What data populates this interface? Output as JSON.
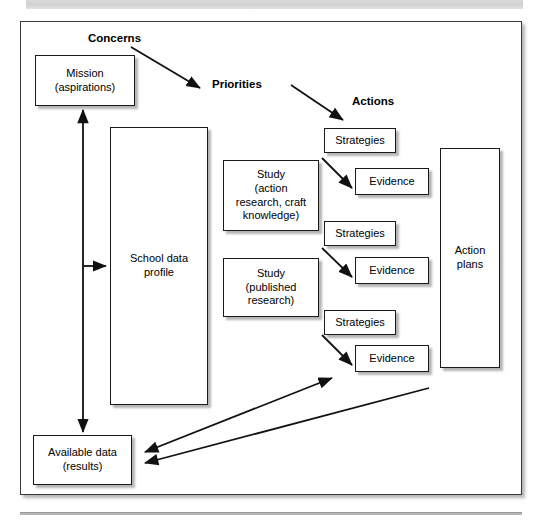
{
  "figure": {
    "type": "process-flow-diagram",
    "headings": [
      {
        "id": "concerns",
        "label": "Concerns",
        "x": 88,
        "y": 32
      },
      {
        "id": "priorities",
        "label": "Priorities",
        "x": 212,
        "y": 78
      },
      {
        "id": "actions",
        "label": "Actions",
        "x": 352,
        "y": 95
      }
    ],
    "nodes": [
      {
        "id": "mission",
        "label": "Mission\n(aspirations)",
        "x": 35,
        "y": 55,
        "w": 100,
        "h": 51
      },
      {
        "id": "school-data",
        "label": "School data\nprofile",
        "x": 110,
        "y": 127,
        "w": 98,
        "h": 278
      },
      {
        "id": "study-action",
        "label": "Study\n(action\nresearch, craft\nknowledge)",
        "x": 223,
        "y": 160,
        "w": 96,
        "h": 71
      },
      {
        "id": "study-published",
        "label": "Study\n(published\nresearch)",
        "x": 223,
        "y": 258,
        "w": 96,
        "h": 59
      },
      {
        "id": "strategies-1",
        "label": "Strategies",
        "x": 324,
        "y": 128,
        "w": 72,
        "h": 25
      },
      {
        "id": "evidence-1",
        "label": "Evidence",
        "x": 355,
        "y": 168,
        "w": 74,
        "h": 27
      },
      {
        "id": "strategies-2",
        "label": "Strategies",
        "x": 324,
        "y": 221,
        "w": 72,
        "h": 25
      },
      {
        "id": "evidence-2",
        "label": "Evidence",
        "x": 355,
        "y": 257,
        "w": 74,
        "h": 27
      },
      {
        "id": "strategies-3",
        "label": "Strategies",
        "x": 324,
        "y": 310,
        "w": 72,
        "h": 25
      },
      {
        "id": "evidence-3",
        "label": "Evidence",
        "x": 355,
        "y": 345,
        "w": 74,
        "h": 27
      },
      {
        "id": "action-plans",
        "label": "Action\nplans",
        "x": 440,
        "y": 148,
        "w": 60,
        "h": 220
      },
      {
        "id": "available-data",
        "label": "Available data\n(results)",
        "x": 33,
        "y": 435,
        "w": 99,
        "h": 50
      }
    ],
    "connectors": [
      {
        "id": "concerns-to-priorities",
        "from": "concerns",
        "to": "priorities",
        "kind": "arrow",
        "x1": 131,
        "y1": 47,
        "x2": 200,
        "y2": 88
      },
      {
        "id": "priorities-to-actions",
        "from": "priorities",
        "to": "actions",
        "kind": "arrow",
        "x1": 291,
        "y1": 85,
        "x2": 343,
        "y2": 120
      },
      {
        "id": "mission-availabledata",
        "from": "mission",
        "to": "available-data",
        "kind": "double-arrow",
        "x1": 83,
        "y1": 108,
        "x2": 83,
        "y2": 434
      },
      {
        "id": "spine-to-school-data",
        "from": "mission-availabledata",
        "to": "school-data",
        "kind": "arrow",
        "x1": 83,
        "y1": 266,
        "x2": 108,
        "y2": 266
      },
      {
        "id": "study1-to-evidence1",
        "from": "study-action",
        "to": "evidence-1",
        "kind": "arrow",
        "x1": 322,
        "y1": 158,
        "x2": 352,
        "y2": 188
      },
      {
        "id": "study1-to-evidence2",
        "from": "study-action",
        "to": "evidence-2",
        "kind": "arrow",
        "x1": 322,
        "y1": 248,
        "x2": 352,
        "y2": 277
      },
      {
        "id": "study2-to-evidence3",
        "from": "study-published",
        "to": "evidence-3",
        "kind": "arrow",
        "x1": 322,
        "y1": 335,
        "x2": 352,
        "y2": 365
      },
      {
        "id": "availabledata-evidence3",
        "from": "available-data",
        "to": "evidence-3",
        "kind": "double-arrow",
        "x1": 143,
        "y1": 452,
        "x2": 334,
        "y2": 377
      },
      {
        "id": "actionplans-availabledata",
        "from": "action-plans",
        "to": "available-data",
        "kind": "arrow",
        "x1": 143,
        "y1": 463,
        "x2": 431,
        "y2": 387
      }
    ],
    "colors": {
      "line": "#1a1a1a",
      "box_fill": "#ffffff",
      "frame": "#3a3a3a",
      "shadow": "#8c8c8c",
      "band": "#d9d9d9"
    }
  }
}
